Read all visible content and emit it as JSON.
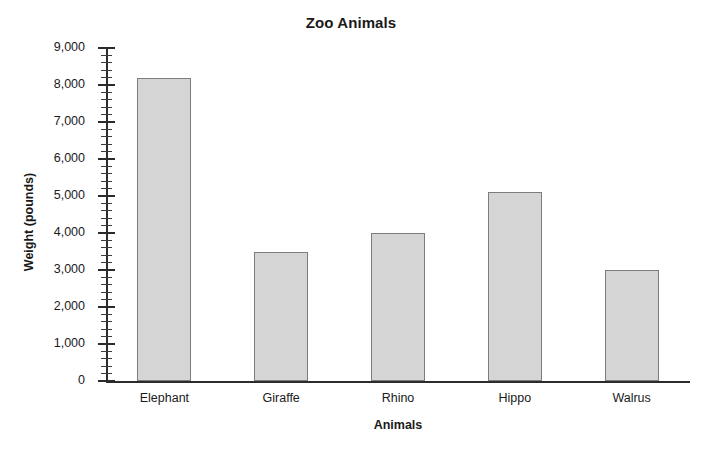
{
  "chart_data": {
    "type": "bar",
    "title": "Zoo Animals",
    "xlabel": "Animals",
    "ylabel": "Weight (pounds)",
    "categories": [
      "Elephant",
      "Giraffe",
      "Rhino",
      "Hippo",
      "Walrus"
    ],
    "values": [
      8200,
      3500,
      4000,
      5100,
      3000
    ],
    "ylim": [
      0,
      9000
    ],
    "ytick_values": [
      0,
      1000,
      2000,
      3000,
      4000,
      5000,
      6000,
      7000,
      8000,
      9000
    ],
    "ytick_labels": [
      "0",
      "1,000",
      "2,000",
      "3,000",
      "4,000",
      "5,000",
      "6,000",
      "7,000",
      "8,000",
      "9,000"
    ],
    "minor_tick_step": 200,
    "grid": false,
    "legend": false,
    "bar_fill_color": "#d5d5d5",
    "bar_border_color": "#7d7d7d",
    "axis_color": "#2b2b2b",
    "background_color": "#ffffff"
  }
}
